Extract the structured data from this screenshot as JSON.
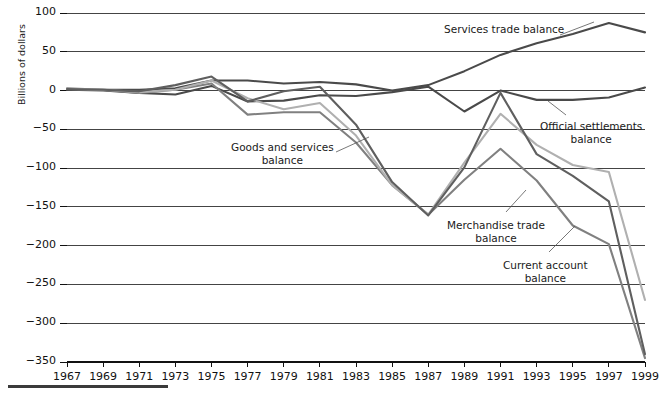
{
  "figure": {
    "ylabel": "Billions of dollars",
    "footer_rule": true
  },
  "annotations": [
    {
      "name": "services-trade-balance",
      "text_lines": [
        "Services trade balance"
      ],
      "x": 444,
      "y": 23
    },
    {
      "name": "goods-and-services-balance",
      "text_lines": [
        "Goods and services",
        "balance"
      ],
      "x": 231,
      "y": 141
    },
    {
      "name": "official-settlements-balance",
      "text_lines": [
        "Official settlements",
        "balance"
      ],
      "x": 540,
      "y": 120
    },
    {
      "name": "merchandise-trade-balance",
      "text_lines": [
        "Merchandise trade",
        "balance"
      ],
      "x": 447,
      "y": 219
    },
    {
      "name": "current-account-balance",
      "text_lines": [
        "Current account",
        "balance"
      ],
      "x": 503,
      "y": 259
    }
  ],
  "colors": {
    "services_trade": "#4a4a4a",
    "official_settlements": "#4a4a4a",
    "merchandise_trade": "#808080",
    "goods_and_services": "#b0b0b0",
    "current_account": "#5f5f5f",
    "axis": "#111111",
    "grid": "#444444"
  },
  "chart_data": {
    "type": "line",
    "title": "",
    "xlabel": "",
    "ylabel": "Billions of dollars",
    "ylim": [
      -350,
      100
    ],
    "xlim": [
      1967,
      1999
    ],
    "grid": true,
    "legend": "annotations",
    "ytick_values": [
      100,
      50,
      0,
      -50,
      -100,
      -150,
      -200,
      -250,
      -300,
      -350
    ],
    "ytick_labels": [
      "100",
      "50",
      "0",
      "−50",
      "−100",
      "−150",
      "−200",
      "−250",
      "−300",
      "−350"
    ],
    "x": [
      1967,
      1969,
      1971,
      1973,
      1975,
      1977,
      1979,
      1981,
      1983,
      1985,
      1987,
      1989,
      1991,
      1993,
      1995,
      1997,
      1999
    ],
    "xtick_labels": [
      "1967",
      "1969",
      "1971",
      "1973",
      "1975",
      "1977",
      "1979",
      "1981",
      "1983",
      "1985",
      "1987",
      "1989",
      "1991",
      "1993",
      "1995",
      "1997",
      "1999"
    ],
    "series": [
      {
        "name": "Services trade balance",
        "color": "#4a4a4a",
        "values": [
          1,
          1,
          1,
          3,
          13,
          13,
          9,
          11,
          8,
          0,
          7,
          25,
          46,
          61,
          73,
          87,
          75
        ]
      },
      {
        "name": "Official settlements balance",
        "color": "#4a4a4a",
        "values": [
          1,
          0,
          -3,
          -5,
          6,
          -14,
          -13,
          -6,
          -7,
          -2,
          5,
          -27,
          0,
          -12,
          -12,
          -9,
          4
        ]
      },
      {
        "name": "Merchandise trade balance",
        "color": "#808080",
        "values": [
          3,
          1,
          -3,
          1,
          9,
          -31,
          -28,
          -28,
          -67,
          -122,
          -160,
          -115,
          -75,
          -116,
          -174,
          -198,
          -345
        ]
      },
      {
        "name": "Goods and services balance",
        "color": "#b0b0b0",
        "values": [
          2,
          1,
          -2,
          1,
          13,
          -10,
          -24,
          -16,
          -58,
          -122,
          -160,
          -93,
          -30,
          -70,
          -96,
          -105,
          -270
        ]
      },
      {
        "name": "Current account balance",
        "color": "#5f5f5f",
        "values": [
          2,
          1,
          -1,
          7,
          18,
          -14,
          -1,
          5,
          -44,
          -118,
          -161,
          -99,
          -3,
          -82,
          -110,
          -143,
          -340
        ]
      }
    ]
  }
}
